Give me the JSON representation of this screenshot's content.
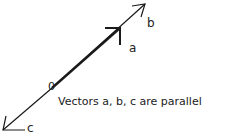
{
  "diagram": {
    "labels": {
      "a": "a",
      "b": "b",
      "c": "c",
      "origin": "0"
    },
    "caption": "Vectors a, b, c are parallel",
    "stroke_color": "#1a1a1a"
  }
}
